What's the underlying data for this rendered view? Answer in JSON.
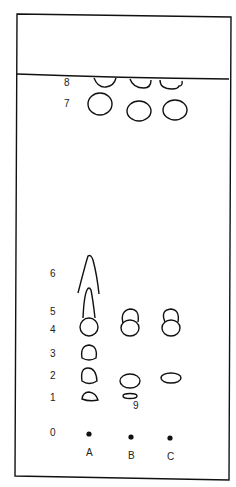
{
  "diagram": {
    "type": "thin-layer-chromatogram",
    "rf_labels": [
      "0",
      "1",
      "2",
      "3",
      "4",
      "5",
      "6",
      "7",
      "8"
    ],
    "lanes": [
      "A",
      "B",
      "C"
    ],
    "spot_label": "9",
    "line_color": "#111111",
    "background": "#ffffff"
  }
}
